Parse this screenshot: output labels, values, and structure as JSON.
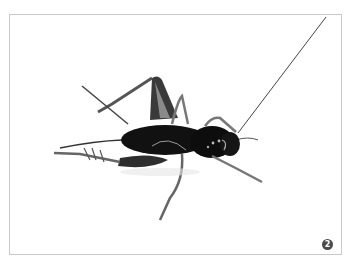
{
  "figure": {
    "caption_number": "2",
    "background_color": "#ffffff",
    "frame_color": "#c9c9c9",
    "insect_color": "#111111",
    "leg_color": "#555555",
    "badge_color": "#4a4a4a"
  }
}
